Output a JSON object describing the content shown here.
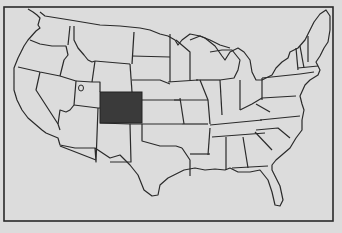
{
  "map": {
    "title": "",
    "subject": "United States state outline map with one state highlighted",
    "highlighted_state": "Colorado",
    "colors": {
      "paper": "#dcdcdc",
      "land": "#dedede",
      "border": "#2a2a2a",
      "highlight": "#3a3a3a"
    },
    "frame": {
      "x": 4,
      "y": 6,
      "width": 330,
      "height": 216
    }
  }
}
